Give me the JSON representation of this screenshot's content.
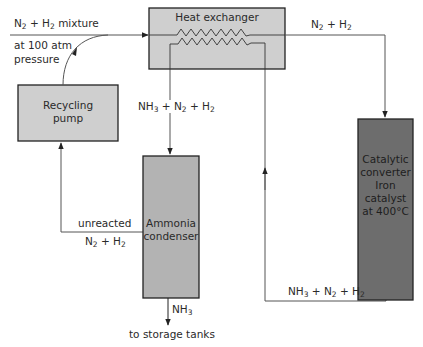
{
  "diagram": {
    "colors": {
      "light_box": "#cfcfcf",
      "mid_box": "#b3b3b3",
      "dark_box": "#6d6d6d",
      "line": "#555555",
      "border": "#222222"
    },
    "nodes": {
      "heat_exchanger": {
        "label": "Heat exchanger"
      },
      "recycling_pump": {
        "line1": "Recycling",
        "line2": "pump"
      },
      "ammonia_condenser": {
        "line1": "Ammonia",
        "line2": "condenser"
      },
      "catalytic_converter": {
        "line1": "Catalytic",
        "line2": "converter",
        "line3": "Iron",
        "line4": "catalyst",
        "line5": "at 400°C"
      }
    },
    "labels": {
      "feed": {
        "n": "N",
        "n_sub": "2",
        "plus": " + H",
        "h_sub": "2",
        "rest": " mixture",
        "line2": "at 100 atm",
        "line3": "pressure"
      },
      "to_converter": {
        "a": "N",
        "a_sub": "2",
        "b": " + H",
        "b_sub": "2"
      },
      "to_condenser": {
        "a": "NH",
        "a_sub": "3",
        "b": " + N",
        "b_sub": "2",
        "c": " + H",
        "c_sub": "2"
      },
      "from_converter": {
        "a": "NH",
        "a_sub": "3",
        "b": " + N",
        "b_sub": "2",
        "c": " + H",
        "c_sub": "2"
      },
      "unreacted": {
        "line1": "unreacted",
        "a": "N",
        "a_sub": "2",
        "b": " + H",
        "b_sub": "2"
      },
      "product": {
        "a": "NH",
        "a_sub": "3"
      },
      "storage": "to storage tanks"
    }
  }
}
